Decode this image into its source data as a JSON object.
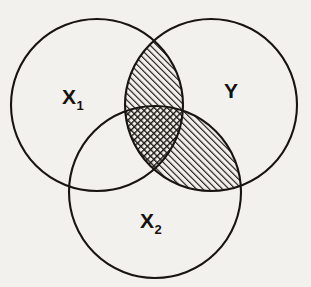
{
  "figure": {
    "background_color": "#f3f1ee",
    "ink_color": "#18140f",
    "labels": {
      "set_a": "X",
      "set_a_sub": "1",
      "set_b": "Y",
      "set_c": "X",
      "set_c_sub": "2"
    }
  },
  "chart_data": {
    "type": "diagram",
    "diagram_type": "venn",
    "sets": [
      {
        "id": "x1",
        "label": "X",
        "subscript": "1",
        "label_full": "X₁",
        "cx": 97,
        "cy": 105,
        "r": 86,
        "label_x": 62,
        "label_y": 104
      },
      {
        "id": "y",
        "label": "Y",
        "subscript": "",
        "label_full": "Y",
        "cx": 211,
        "cy": 105,
        "r": 86,
        "label_x": 224,
        "label_y": 98
      },
      {
        "id": "x2",
        "label": "X",
        "subscript": "2",
        "label_full": "X₂",
        "cx": 155,
        "cy": 192,
        "r": 86,
        "label_x": 140,
        "label_y": 228
      }
    ],
    "regions": [
      {
        "id": "x1-only",
        "sets": [
          "x1"
        ],
        "fill": "none",
        "shaded": false
      },
      {
        "id": "y-only",
        "sets": [
          "y"
        ],
        "fill": "none",
        "shaded": false
      },
      {
        "id": "x2-only",
        "sets": [
          "x2"
        ],
        "fill": "none",
        "shaded": false
      },
      {
        "id": "x1-y",
        "sets": [
          "x1",
          "y"
        ],
        "fill": "diagonal-hatch",
        "shaded": true
      },
      {
        "id": "y-x2",
        "sets": [
          "y",
          "x2"
        ],
        "fill": "diagonal-hatch",
        "shaded": true
      },
      {
        "id": "x1-x2",
        "sets": [
          "x1",
          "x2"
        ],
        "fill": "none",
        "shaded": false
      },
      {
        "id": "x1-y-x2",
        "sets": [
          "x1",
          "y",
          "x2"
        ],
        "fill": "cross-hatch",
        "shaded": true
      }
    ],
    "hatch": {
      "diagonal_angle_deg": 45,
      "diagonal_spacing_px": 4.6,
      "cross_spacing_px": 4.6,
      "stroke_color": "#18140f"
    },
    "legend": null,
    "grid": false
  },
  "bleed_text": {
    "note": "faint show-through text from reverse of scanned page",
    "lines": [
      {
        "text": "in many fields have tried to build and imagine structures",
        "x": 10,
        "y": 4
      },
      {
        "text": "other variables that are conceptually similar in every case",
        "x": 12,
        "y": 19
      },
      {
        "text": "we consider carefully the nature of the observations and",
        "x": 10,
        "y": 34
      },
      {
        "text": "operations",
        "x": 14,
        "y": 49
      },
      {
        "text": "Problems of measurement",
        "x": 12,
        "y": 92
      },
      {
        "text": "these are available for use and need to be relevant",
        "x": 8,
        "y": 122
      },
      {
        "text": "to the same structures with individual differences in",
        "x": 9,
        "y": 137
      },
      {
        "text": "individual aspects of research. Each is important in",
        "x": 10,
        "y": 152
      },
      {
        "text": "how it is possible to consider every case may be part",
        "x": 9,
        "y": 167
      },
      {
        "text": "of the entire group of people and whether there are",
        "x": 10,
        "y": 182
      },
      {
        "text": "some more consistent correlates between measures",
        "x": 8,
        "y": 197
      },
      {
        "text": "constructs arise more readily in studying differences",
        "x": 9,
        "y": 212
      },
      {
        "text": "in any indirect reference about the nature of these",
        "x": 10,
        "y": 227
      },
      {
        "text": "of the studies in problems with fine line of analysis",
        "x": 8,
        "y": 242
      },
      {
        "text": "and direct behaviour and understanding differences",
        "x": 9,
        "y": 257
      }
    ]
  }
}
